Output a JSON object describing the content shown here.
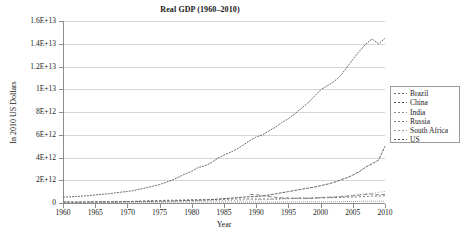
{
  "chart_data": {
    "type": "line",
    "title": "Real GDP (1960–2010)",
    "xlabel": "Year",
    "ylabel": "In 2010 US Dollars",
    "grid": true,
    "legend_position": "right",
    "xlim": [
      1960,
      2010
    ],
    "ylim": [
      0,
      16000000000000
    ],
    "xticks": [
      "1960",
      "1965",
      "1970",
      "1975",
      "1980",
      "1985",
      "1990",
      "1995",
      "2000",
      "2005",
      "2010"
    ],
    "xtick_values": [
      1960,
      1965,
      1970,
      1975,
      1980,
      1985,
      1990,
      1995,
      2000,
      2005,
      2010
    ],
    "yticks": [
      "0",
      "2E+12",
      "4E+12",
      "6E+12",
      "8E+12",
      "1E+13",
      "1.2E+13",
      "1.4E+13",
      "1.6E+13"
    ],
    "ytick_values": [
      0,
      2000000000000,
      4000000000000,
      6000000000000,
      8000000000000,
      10000000000000,
      12000000000000,
      14000000000000,
      16000000000000
    ],
    "x": [
      1960,
      1961,
      1962,
      1963,
      1964,
      1965,
      1966,
      1967,
      1968,
      1969,
      1970,
      1971,
      1972,
      1973,
      1974,
      1975,
      1976,
      1977,
      1978,
      1979,
      1980,
      1981,
      1982,
      1983,
      1984,
      1985,
      1986,
      1987,
      1988,
      1989,
      1990,
      1991,
      1992,
      1993,
      1994,
      1995,
      1996,
      1997,
      1998,
      1999,
      2000,
      2001,
      2002,
      2003,
      2004,
      2005,
      2006,
      2007,
      2008,
      2009,
      2010
    ],
    "series": [
      {
        "name": "Brazil",
        "color": "#6e6e6e",
        "dash": "2 2",
        "values": [
          70000000000.0,
          76000000000.0,
          82000000000.0,
          83000000000.0,
          86000000000.0,
          89000000000.0,
          95000000000.0,
          99000000000.0,
          109000000000.0,
          120000000000.0,
          133000000000.0,
          148000000000.0,
          166000000000.0,
          189000000000.0,
          205000000000.0,
          216000000000.0,
          238000000000.0,
          249000000000.0,
          261000000000.0,
          278000000000.0,
          299000000000.0,
          286000000000.0,
          289000000000.0,
          279000000000.0,
          294000000000.0,
          318000000000.0,
          343000000000.0,
          355000000000.0,
          354000000000.0,
          365000000000.0,
          349000000000.0,
          353000000000.0,
          351000000000.0,
          368000000000.0,
          390000000000.0,
          407000000000.0,
          416000000000.0,
          430000000000.0,
          431000000000.0,
          433000000000.0,
          452000000000.0,
          458000000000.0,
          470000000000.0,
          476000000000.0,
          504000000000.0,
          520000000000.0,
          541000000000.0,
          574000000000.0,
          603000000000.0,
          597000000000.0,
          642000000000.0
        ]
      },
      {
        "name": "China",
        "color": "#545454",
        "dash": "3 1",
        "values": [
          95000000000.0,
          69000000000.0,
          64000000000.0,
          70000000000.0,
          80000000000.0,
          93000000000.0,
          102000000000.0,
          95000000000.0,
          91000000000.0,
          106000000000.0,
          126000000000.0,
          135000000000.0,
          139000000000.0,
          150000000000.0,
          153000000000.0,
          166000000000.0,
          163000000000.0,
          176000000000.0,
          200000000000.0,
          216000000000.0,
          233000000000.0,
          245000000000.0,
          267000000000.0,
          296000000000.0,
          341000000000.0,
          387000000000.0,
          421000000000.0,
          470000000000.0,
          524000000000.0,
          545000000000.0,
          566000000000.0,
          618000000000.0,
          706000000000.0,
          801000000000.0,
          906000000000.0,
          1000000000000.0,
          1100000000000.0,
          1210000000000.0,
          1300000000000.0,
          1400000000000.0,
          1520000000000.0,
          1650000000000.0,
          1800000000000.0,
          2000000000000.0,
          2200000000000.0,
          2450000000000.0,
          2760000000000.0,
          3150000000000.0,
          3450000000000.0,
          3770000000000.0,
          4990000000000.0
        ]
      },
      {
        "name": "India",
        "color": "#8a8a8a",
        "dash": "1 2",
        "values": [
          83000000000.0,
          86000000000.0,
          89000000000.0,
          94000000000.0,
          101000000000.0,
          96000000000.0,
          97000000000.0,
          105000000000.0,
          108000000000.0,
          115000000000.0,
          121000000000.0,
          122000000000.0,
          121000000000.0,
          126000000000.0,
          128000000000.0,
          140000000000.0,
          142000000000.0,
          153000000000.0,
          161000000000.0,
          152000000000.0,
          163000000000.0,
          173000000000.0,
          180000000000.0,
          193000000000.0,
          201000000000.0,
          212000000000.0,
          222000000000.0,
          231000000000.0,
          255000000000.0,
          271000000000.0,
          286000000000.0,
          288000000000.0,
          304000000000.0,
          320000000000.0,
          341000000000.0,
          366000000000.0,
          394000000000.0,
          410000000000.0,
          437000000000.0,
          474000000000.0,
          493000000000.0,
          519000000000.0,
          539000000000.0,
          581000000000.0,
          627000000000.0,
          689000000000.0,
          754000000000.0,
          831000000000.0,
          864000000000.0,
          938000000000.0,
          1020000000000.0
        ]
      },
      {
        "name": "Russia",
        "color": "#777777",
        "dash": "4 2",
        "values": [
          null,
          null,
          null,
          null,
          null,
          null,
          null,
          null,
          null,
          null,
          null,
          null,
          null,
          null,
          null,
          null,
          null,
          null,
          null,
          null,
          null,
          null,
          null,
          null,
          null,
          null,
          null,
          null,
          null,
          740000000000.0,
          720000000000.0,
          660000000000.0,
          560000000000.0,
          510000000000.0,
          450000000000.0,
          430000000000.0,
          410000000000.0,
          420000000000.0,
          390000000000.0,
          420000000000.0,
          470000000000.0,
          490000000000.0,
          510000000000.0,
          550000000000.0,
          590000000000.0,
          630000000000.0,
          690000000000.0,
          750000000000.0,
          790000000000.0,
          720000000000.0,
          760000000000.0
        ]
      },
      {
        "name": "South Africa",
        "color": "#9c9c9c",
        "dash": "1 1",
        "values": [
          32000000000.0,
          33000000000.0,
          35000000000.0,
          38000000000.0,
          41000000000.0,
          44000000000.0,
          46000000000.0,
          50000000000.0,
          52000000000.0,
          55000000000.0,
          58000000000.0,
          60000000000.0,
          61000000000.0,
          64000000000.0,
          68000000000.0,
          69000000000.0,
          70000000000.0,
          69000000000.0,
          71000000000.0,
          74000000000.0,
          79000000000.0,
          83000000000.0,
          82000000000.0,
          80000000000.0,
          85000000000.0,
          84000000000.0,
          83000000000.0,
          85000000000.0,
          89000000000.0,
          91000000000.0,
          90000000000.0,
          89000000000.0,
          87000000000.0,
          88000000000.0,
          91000000000.0,
          94000000000.0,
          98000000000.0,
          101000000000.0,
          102000000000.0,
          104000000000.0,
          108000000000.0,
          111000000000.0,
          115000000000.0,
          119000000000.0,
          125000000000.0,
          131000000000.0,
          138000000000.0,
          146000000000.0,
          151000000000.0,
          149000000000.0,
          154000000000.0
        ]
      },
      {
        "name": "US",
        "color": "#5a5a5a",
        "dash": "2 1",
        "values": [
          520000000000.0,
          535000000000.0,
          575000000000.0,
          605000000000.0,
          650000000000.0,
          705000000000.0,
          770000000000.0,
          810000000000.0,
          885000000000.0,
          955000000000.0,
          1010000000000.0,
          1100000000000.0,
          1220000000000.0,
          1360000000000.0,
          1480000000000.0,
          1620000000000.0,
          1820000000000.0,
          2030000000000.0,
          2290000000000.0,
          2560000000000.0,
          2790000000000.0,
          3130000000000.0,
          3260000000000.0,
          3530000000000.0,
          3930000000000.0,
          4220000000000.0,
          4460000000000.0,
          4740000000000.0,
          5100000000000.0,
          5480000000000.0,
          5800000000000.0,
          5990000000000.0,
          6340000000000.0,
          6670000000000.0,
          7080000000000.0,
          7410000000000.0,
          7840000000000.0,
          8320000000000.0,
          8790000000000.0,
          9350000000000.0,
          9950000000000.0,
          10290000000000.0,
          10640000000000.0,
          11140000000000.0,
          11860000000000.0,
          12610000000000.0,
          13340000000000.0,
          13960000000000.0,
          14420000000000.0,
          14000000000000.0,
          14480000000000.0
        ]
      }
    ]
  }
}
